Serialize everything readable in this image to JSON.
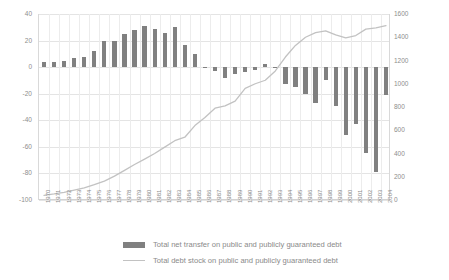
{
  "chart_data": {
    "type": "bar",
    "title": "",
    "subtitle": "",
    "xlabel": "",
    "ylabel": "",
    "y2label": "",
    "grid": true,
    "legend_position": "bottom",
    "categories": [
      "1970",
      "1971",
      "1972",
      "1973",
      "1974",
      "1975",
      "1976",
      "1977",
      "1978",
      "1979",
      "1980",
      "1981",
      "1982",
      "1983",
      "1984",
      "1985",
      "1986",
      "1987",
      "1988",
      "1989",
      "1990",
      "1991",
      "1992",
      "1993",
      "1994",
      "1995",
      "1996",
      "1997",
      "1998",
      "1999",
      "2000",
      "2001",
      "2002",
      "2003",
      "2004"
    ],
    "ylim": [
      -100,
      40
    ],
    "yticks": [
      40,
      20,
      0,
      -20,
      -40,
      -60,
      -80,
      -100
    ],
    "y2lim": [
      0,
      1600
    ],
    "y2ticks": [
      1600,
      1400,
      1200,
      1000,
      800,
      600,
      400,
      200,
      0
    ],
    "series": [
      {
        "name": "Total net transfer on public and publicly guaranteed debt",
        "type": "bar",
        "axis": "left",
        "color": "#808080",
        "values": [
          4,
          4,
          5,
          7,
          8,
          12,
          20,
          20,
          25,
          28,
          31,
          29,
          26,
          30,
          17,
          10,
          -1,
          -3,
          -8,
          -5,
          -4,
          -2,
          2,
          -1,
          -13,
          -15,
          -20,
          -27,
          -10,
          -29,
          -51,
          -43,
          -65,
          -79,
          -21
        ]
      },
      {
        "name": "Total debt stock on public and publicly guaranteed debt",
        "type": "line",
        "axis": "right",
        "color": "#c2c2c2",
        "values": [
          40,
          52,
          66,
          85,
          105,
          132,
          163,
          205,
          255,
          305,
          352,
          400,
          455,
          510,
          540,
          640,
          710,
          790,
          810,
          850,
          960,
          1000,
          1030,
          1110,
          1230,
          1330,
          1400,
          1440,
          1455,
          1420,
          1395,
          1415,
          1470,
          1480,
          1500
        ]
      }
    ]
  },
  "legend": {
    "items": [
      {
        "label": "Total net transfer on public and publicly guaranteed debt",
        "marker": "bar-swatch"
      },
      {
        "label": "Total debt stock on public and publicly guaranteed debt",
        "marker": "line-swatch"
      }
    ]
  }
}
